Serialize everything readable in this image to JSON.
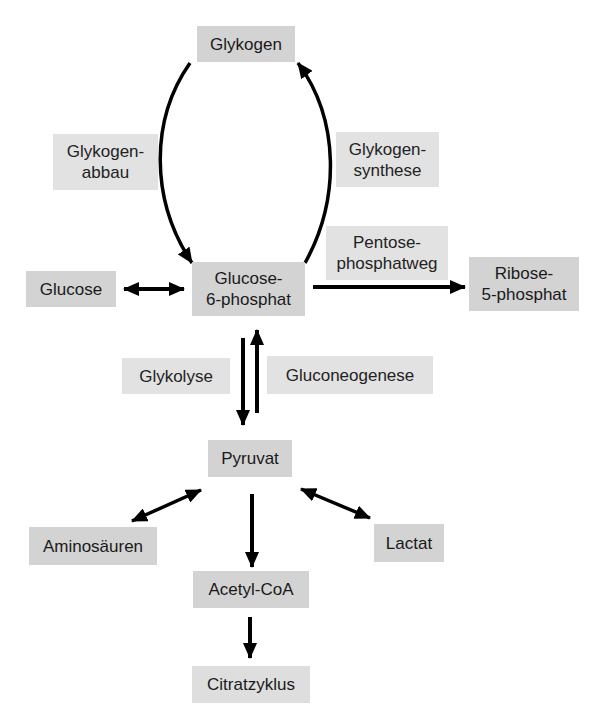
{
  "diagram": {
    "title": "",
    "nodes": {
      "glykogen": "Glykogen",
      "glucose": "Glucose",
      "glucose6p": "Glucose-\n6-phosphat",
      "ribose5p": "Ribose-\n5-phosphat",
      "pyruvat": "Pyruvat",
      "aminosaeuren": "Aminosäuren",
      "lactat": "Lactat",
      "acetylcoa": "Acetyl-CoA",
      "citratzyklus": "Citratzyklus"
    },
    "pathway_labels": {
      "glykogenabbau": "Glykogen-\nabbau",
      "glykogensynthese": "Glykogen-\nsynthese",
      "pentosephosphatweg": "Pentose-\nphosphatweg",
      "glykolyse": "Glykolyse",
      "gluconeogenese": "Gluconeogenese"
    },
    "edges": [
      {
        "from": "Glykogen",
        "to": "Glucose-6-phosphat",
        "label": "Glykogenabbau",
        "direction": "forward"
      },
      {
        "from": "Glucose-6-phosphat",
        "to": "Glykogen",
        "label": "Glykogensynthese",
        "direction": "forward"
      },
      {
        "from": "Glucose",
        "to": "Glucose-6-phosphat",
        "direction": "bidirectional"
      },
      {
        "from": "Glucose-6-phosphat",
        "to": "Ribose-5-phosphat",
        "label": "Pentosephosphatweg",
        "direction": "forward"
      },
      {
        "from": "Glucose-6-phosphat",
        "to": "Pyruvat",
        "label": "Glykolyse",
        "direction": "forward"
      },
      {
        "from": "Pyruvat",
        "to": "Glucose-6-phosphat",
        "label": "Gluconeogenese",
        "direction": "forward"
      },
      {
        "from": "Pyruvat",
        "to": "Aminosäuren",
        "direction": "bidirectional"
      },
      {
        "from": "Pyruvat",
        "to": "Lactat",
        "direction": "bidirectional"
      },
      {
        "from": "Pyruvat",
        "to": "Acetyl-CoA",
        "direction": "forward"
      },
      {
        "from": "Acetyl-CoA",
        "to": "Citratzyklus",
        "direction": "forward"
      }
    ],
    "colors": {
      "node_fill": "#d3d3d3",
      "label_fill": "#e2e2e2",
      "arrow": "#000000",
      "text": "#1a1a1a"
    }
  }
}
